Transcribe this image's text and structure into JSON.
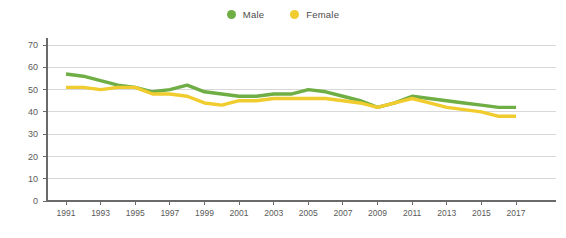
{
  "chart_data": {
    "type": "line",
    "title": "",
    "subtitle": "",
    "xlabel": "",
    "ylabel": "",
    "xlim": [
      1991,
      2017
    ],
    "ylim": [
      0,
      70
    ],
    "grid": true,
    "legend_position": "top-center",
    "x": [
      1991,
      1992,
      1993,
      1994,
      1995,
      1996,
      1997,
      1998,
      1999,
      2000,
      2001,
      2002,
      2003,
      2004,
      2005,
      2006,
      2007,
      2008,
      2009,
      2010,
      2011,
      2012,
      2013,
      2014,
      2015,
      2016,
      2017
    ],
    "xtick_labels": [
      "1991",
      "1993",
      "1995",
      "1997",
      "1999",
      "2001",
      "2003",
      "2005",
      "2007",
      "2009",
      "2011",
      "2013",
      "2015",
      "2017"
    ],
    "xticks": [
      1991,
      1993,
      1995,
      1997,
      1999,
      2001,
      2003,
      2005,
      2007,
      2009,
      2011,
      2013,
      2015,
      2017
    ],
    "ytick_labels": [
      "0",
      "10",
      "20",
      "30",
      "40",
      "50",
      "60",
      "70"
    ],
    "yticks": [
      0,
      10,
      20,
      30,
      40,
      50,
      60,
      70
    ],
    "series": [
      {
        "name": "Male",
        "color": "#6fae44",
        "values": [
          57,
          56,
          54,
          52,
          51,
          49,
          50,
          52,
          49,
          48,
          47,
          47,
          48,
          48,
          50,
          49,
          47,
          45,
          42,
          44,
          47,
          46,
          45,
          44,
          43,
          42,
          42
        ]
      },
      {
        "name": "Female",
        "color": "#f0cc2e",
        "values": [
          51,
          51,
          50,
          51,
          51,
          48,
          48,
          47,
          44,
          43,
          45,
          45,
          46,
          46,
          46,
          46,
          45,
          44,
          42,
          44,
          46,
          44,
          42,
          41,
          40,
          38,
          38
        ]
      }
    ]
  },
  "legend": {
    "items": [
      {
        "label": "Male",
        "color": "#6fae44"
      },
      {
        "label": "Female",
        "color": "#f0cc2e"
      }
    ]
  },
  "colors": {
    "male": "#6fae44",
    "female": "#f0cc2e",
    "grid": "#d8d8d8",
    "axis": "#6a6a6a",
    "tick_text": "#5a5a5a",
    "background": "#ffffff"
  }
}
